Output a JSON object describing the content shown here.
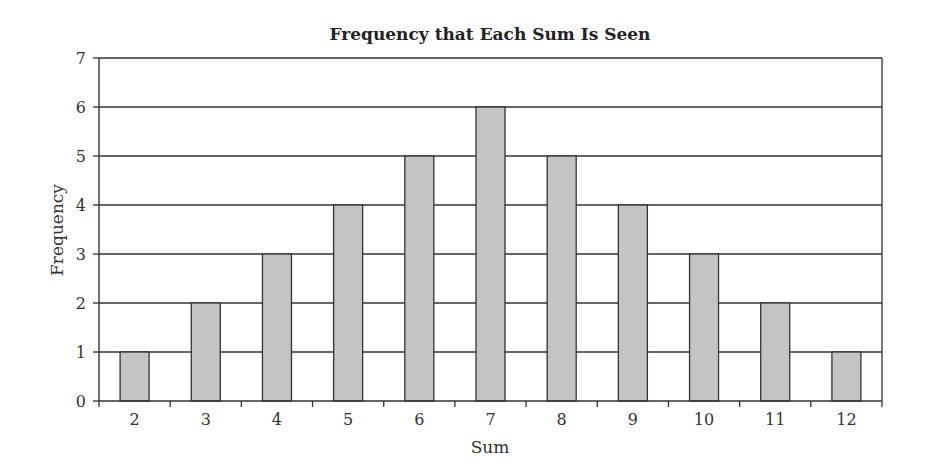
{
  "chart_data": {
    "type": "bar",
    "title": "Frequency that Each Sum Is Seen",
    "xlabel": "Sum",
    "ylabel": "Frequency",
    "categories": [
      "2",
      "3",
      "4",
      "5",
      "6",
      "7",
      "8",
      "9",
      "10",
      "11",
      "12"
    ],
    "values": [
      1,
      2,
      3,
      4,
      5,
      6,
      5,
      4,
      3,
      2,
      1
    ],
    "ylim": [
      0,
      7
    ],
    "yticks": [
      0,
      1,
      2,
      3,
      4,
      5,
      6,
      7
    ],
    "grid": true,
    "legend": null,
    "colors": {
      "bar_fill": "#c4c4c4",
      "bar_stroke": "#333333",
      "grid": "#333333"
    }
  }
}
